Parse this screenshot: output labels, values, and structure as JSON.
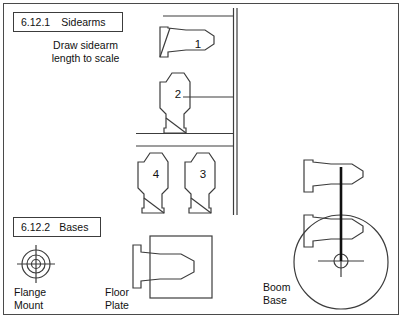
{
  "page": {
    "width": 403,
    "height": 319,
    "background": "#ffffff",
    "line_color": "#3c3c3c",
    "text_color": "#111111"
  },
  "sections": {
    "sidearms": {
      "number": "6.12.1",
      "title": "Sidearms",
      "note_line1": "Draw sidearm",
      "note_line2": "length to scale",
      "parts": [
        {
          "id": "1",
          "label": "1",
          "orientation": "horizontal",
          "style": "sidearm-nozzle-flanged"
        },
        {
          "id": "2",
          "label": "2",
          "orientation": "vertical",
          "style": "sidearm-octagon-base"
        },
        {
          "id": "4",
          "label": "4",
          "orientation": "vertical",
          "style": "sidearm-octagon-base"
        },
        {
          "id": "3",
          "label": "3",
          "orientation": "vertical",
          "style": "sidearm-octagon-base"
        }
      ]
    },
    "bases": {
      "number": "6.12.2",
      "title": "Bases",
      "items": [
        {
          "id": "flange-mount",
          "caption_line1": "Flange",
          "caption_line2": "Mount",
          "symbol": "concentric-circles-crosshair"
        },
        {
          "id": "floor-plate",
          "caption_line1": "Floor",
          "caption_line2": "Plate",
          "symbol": "square-plate-with-nozzle"
        },
        {
          "id": "boom-base",
          "caption_line1": "Boom",
          "caption_line2": "Base",
          "symbol": "circle-with-two-arms-and-mast"
        }
      ]
    }
  }
}
